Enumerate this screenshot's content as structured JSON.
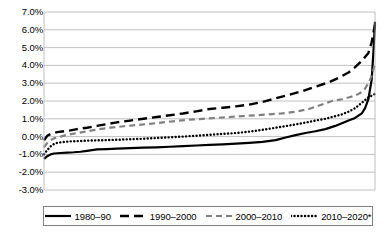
{
  "chart_data": {
    "type": "line",
    "title": "",
    "xlabel": "",
    "ylabel": "",
    "ylim": [
      -3.0,
      7.0
    ],
    "ytick_values": [
      7.0,
      6.0,
      5.0,
      4.0,
      3.0,
      2.0,
      1.0,
      0.0,
      -1.0,
      -2.0,
      -3.0
    ],
    "ytick_labels": [
      "7.0%",
      "6.0%",
      "5.0%",
      "4.0%",
      "3.0%",
      "2.0%",
      "1.0%",
      "0.0%",
      "-1.0%",
      "-2.0%",
      "-3.0%"
    ],
    "xlim": [
      0,
      100
    ],
    "xtick_labels": [],
    "grid": "horizontal",
    "legend_position": "bottom",
    "series": [
      {
        "name": "1980–90",
        "dash": "solid",
        "color": "#000000",
        "x": [
          0,
          1,
          2,
          3,
          5,
          7,
          9,
          11,
          13,
          16,
          19,
          22,
          26,
          30,
          34,
          38,
          42,
          46,
          50,
          54,
          58,
          62,
          66,
          70,
          73,
          76,
          79,
          82,
          85,
          88,
          90,
          92,
          94,
          96,
          97,
          98,
          99,
          99.6,
          100
        ],
        "y": [
          -1.25,
          -1.1,
          -1.0,
          -0.95,
          -0.92,
          -0.9,
          -0.88,
          -0.85,
          -0.8,
          -0.72,
          -0.7,
          -0.68,
          -0.65,
          -0.62,
          -0.6,
          -0.57,
          -0.54,
          -0.5,
          -0.47,
          -0.44,
          -0.4,
          -0.35,
          -0.3,
          -0.2,
          -0.05,
          0.08,
          0.2,
          0.3,
          0.42,
          0.6,
          0.75,
          0.9,
          1.05,
          1.3,
          1.6,
          2.1,
          3.2,
          5.0,
          6.45
        ]
      },
      {
        "name": "1990–2000",
        "dash": "long-dash",
        "color": "#000000",
        "x": [
          0,
          1,
          2,
          3,
          4,
          6,
          8,
          10,
          13,
          16,
          19,
          22,
          26,
          30,
          34,
          38,
          42,
          46,
          50,
          54,
          58,
          62,
          66,
          70,
          74,
          78,
          82,
          86,
          89,
          92,
          94,
          96,
          98,
          99,
          100
        ],
        "y": [
          -0.2,
          0.05,
          0.15,
          0.2,
          0.25,
          0.3,
          0.35,
          0.42,
          0.5,
          0.6,
          0.7,
          0.8,
          0.9,
          1.0,
          1.1,
          1.2,
          1.3,
          1.42,
          1.55,
          1.62,
          1.7,
          1.8,
          1.95,
          2.15,
          2.35,
          2.55,
          2.8,
          3.05,
          3.3,
          3.6,
          3.9,
          4.25,
          4.7,
          5.3,
          6.3
        ]
      },
      {
        "name": "2000–2010",
        "dash": "medium-dash",
        "color": "#808080",
        "x": [
          0,
          1,
          2,
          3,
          5,
          7,
          10,
          13,
          16,
          20,
          24,
          28,
          32,
          36,
          40,
          44,
          48,
          52,
          56,
          60,
          64,
          68,
          72,
          76,
          80,
          84,
          87,
          90,
          92,
          94,
          96,
          97,
          98,
          99,
          100
        ],
        "y": [
          -0.6,
          -0.35,
          -0.2,
          -0.1,
          0.0,
          0.1,
          0.2,
          0.3,
          0.4,
          0.5,
          0.58,
          0.65,
          0.72,
          0.8,
          0.88,
          0.95,
          1.0,
          1.05,
          1.1,
          1.15,
          1.2,
          1.25,
          1.3,
          1.4,
          1.55,
          1.8,
          2.0,
          2.1,
          2.2,
          2.3,
          2.5,
          2.7,
          3.0,
          3.4,
          4.1
        ]
      },
      {
        "name": "2010–2020*",
        "dash": "dotted",
        "color": "#000000",
        "x": [
          0,
          1,
          2,
          3,
          4,
          6,
          8,
          11,
          14,
          18,
          22,
          26,
          30,
          34,
          38,
          42,
          46,
          50,
          54,
          58,
          62,
          66,
          70,
          74,
          78,
          82,
          85,
          88,
          90,
          92,
          94,
          96,
          97,
          98,
          99,
          100
        ],
        "y": [
          -1.0,
          -0.75,
          -0.55,
          -0.42,
          -0.35,
          -0.3,
          -0.27,
          -0.25,
          -0.22,
          -0.2,
          -0.18,
          -0.15,
          -0.12,
          -0.08,
          -0.04,
          0.0,
          0.05,
          0.1,
          0.15,
          0.2,
          0.28,
          0.38,
          0.5,
          0.62,
          0.75,
          0.9,
          1.0,
          1.15,
          1.25,
          1.4,
          1.6,
          1.9,
          2.05,
          2.2,
          2.3,
          2.4
        ]
      }
    ]
  },
  "legend": {
    "items": [
      {
        "label": "1980–90",
        "style": "solid"
      },
      {
        "label": "1990–2000",
        "style": "long-dash"
      },
      {
        "label": "2000–2010",
        "style": "medium-dash"
      },
      {
        "label": "2010–2020*",
        "style": "dotted"
      }
    ]
  }
}
